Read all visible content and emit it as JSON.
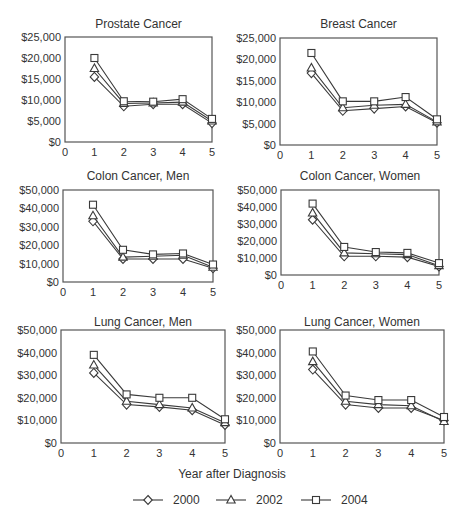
{
  "figure": {
    "xlabel": "Year after Diagnosis",
    "legend": [
      {
        "label": "2000",
        "marker": "diamond"
      },
      {
        "label": "2002",
        "marker": "triangle"
      },
      {
        "label": "2004",
        "marker": "square"
      }
    ]
  },
  "chart_data": [
    {
      "type": "line",
      "title": "Prostate Cancer",
      "xlabel": "Year after Diagnosis",
      "ylabel": "",
      "x": [
        1,
        2,
        3,
        4,
        5
      ],
      "xticks": [
        0,
        1,
        2,
        3,
        4,
        5
      ],
      "xlim": [
        0,
        5
      ],
      "yticks": [
        "$0",
        "$5,000",
        "$10,000",
        "$15,000",
        "$20,000",
        "$25,000"
      ],
      "ylim": [
        0,
        25000
      ],
      "grid": false,
      "series": [
        {
          "name": "2000",
          "marker": "diamond",
          "values": [
            15500,
            8500,
            9000,
            9000,
            4500
          ]
        },
        {
          "name": "2002",
          "marker": "triangle",
          "values": [
            17500,
            9200,
            9300,
            9500,
            5000
          ]
        },
        {
          "name": "2004",
          "marker": "square",
          "values": [
            20000,
            9700,
            9600,
            10200,
            5500
          ]
        }
      ]
    },
    {
      "type": "line",
      "title": "Breast Cancer",
      "xlabel": "Year after Diagnosis",
      "ylabel": "",
      "x": [
        1,
        2,
        3,
        4,
        5
      ],
      "xticks": [
        0,
        1,
        2,
        3,
        4,
        5
      ],
      "xlim": [
        0,
        5
      ],
      "yticks": [
        "$0",
        "$5,000",
        "$10,000",
        "$15,000",
        "$20,000",
        "$25,000"
      ],
      "ylim": [
        0,
        25000
      ],
      "grid": false,
      "series": [
        {
          "name": "2000",
          "marker": "diamond",
          "values": [
            16800,
            8000,
            8500,
            9000,
            5200
          ]
        },
        {
          "name": "2002",
          "marker": "triangle",
          "values": [
            18000,
            8700,
            9300,
            9500,
            5400
          ]
        },
        {
          "name": "2004",
          "marker": "square",
          "values": [
            21500,
            10200,
            10200,
            11200,
            6000
          ]
        }
      ]
    },
    {
      "type": "line",
      "title": "Colon Cancer, Men",
      "xlabel": "Year after Diagnosis",
      "ylabel": "",
      "x": [
        1,
        2,
        3,
        4,
        5
      ],
      "xticks": [
        0,
        1,
        2,
        3,
        4,
        5
      ],
      "xlim": [
        0,
        5
      ],
      "yticks": [
        "$0",
        "$10,000",
        "$20,000",
        "$30,000",
        "$40,000",
        "$50,000"
      ],
      "ylim": [
        0,
        50000
      ],
      "grid": false,
      "series": [
        {
          "name": "2000",
          "marker": "diamond",
          "values": [
            33000,
            12500,
            12500,
            12500,
            7500
          ]
        },
        {
          "name": "2002",
          "marker": "triangle",
          "values": [
            36000,
            13500,
            14000,
            14500,
            8000
          ]
        },
        {
          "name": "2004",
          "marker": "square",
          "values": [
            42000,
            17500,
            15000,
            15500,
            9500
          ]
        }
      ]
    },
    {
      "type": "line",
      "title": "Colon Cancer, Women",
      "xlabel": "Year after Diagnosis",
      "ylabel": "",
      "x": [
        1,
        2,
        3,
        4,
        5
      ],
      "xticks": [
        0,
        1,
        2,
        3,
        4,
        5
      ],
      "xlim": [
        0,
        5
      ],
      "yticks": [
        "$0",
        "$10,000",
        "$20,000",
        "$30,000",
        "$40,000",
        "$50,000"
      ],
      "ylim": [
        0,
        50000
      ],
      "grid": false,
      "series": [
        {
          "name": "2000",
          "marker": "diamond",
          "values": [
            32500,
            11000,
            11000,
            10500,
            5000
          ]
        },
        {
          "name": "2002",
          "marker": "triangle",
          "values": [
            36500,
            13000,
            12500,
            12000,
            5500
          ]
        },
        {
          "name": "2004",
          "marker": "square",
          "values": [
            42000,
            16500,
            13500,
            13000,
            7000
          ]
        }
      ]
    },
    {
      "type": "line",
      "title": "Lung Cancer, Men",
      "xlabel": "Year after Diagnosis",
      "ylabel": "",
      "x": [
        1,
        2,
        3,
        4,
        5
      ],
      "xticks": [
        0,
        1,
        2,
        3,
        4,
        5
      ],
      "xlim": [
        0,
        5
      ],
      "yticks": [
        "$0",
        "$10,000",
        "$20,000",
        "$30,000",
        "$40,000",
        "$50,000"
      ],
      "ylim": [
        0,
        50000
      ],
      "grid": false,
      "series": [
        {
          "name": "2000",
          "marker": "diamond",
          "values": [
            31000,
            17000,
            16000,
            14500,
            8000
          ]
        },
        {
          "name": "2002",
          "marker": "triangle",
          "values": [
            34500,
            18500,
            17000,
            15500,
            9000
          ]
        },
        {
          "name": "2004",
          "marker": "square",
          "values": [
            39000,
            21500,
            20000,
            20000,
            10500
          ]
        }
      ]
    },
    {
      "type": "line",
      "title": "Lung Cancer, Women",
      "xlabel": "Year after Diagnosis",
      "ylabel": "",
      "x": [
        1,
        2,
        3,
        4,
        5
      ],
      "xticks": [
        0,
        1,
        2,
        3,
        4,
        5
      ],
      "xlim": [
        0,
        5
      ],
      "yticks": [
        "$0",
        "$10,000",
        "$20,000",
        "$30,000",
        "$40,000",
        "$50,000"
      ],
      "ylim": [
        0,
        50000
      ],
      "grid": false,
      "series": [
        {
          "name": "2000",
          "marker": "diamond",
          "values": [
            32500,
            17000,
            15500,
            15500,
            10000
          ]
        },
        {
          "name": "2002",
          "marker": "triangle",
          "values": [
            36000,
            18500,
            17000,
            16500,
            9500
          ]
        },
        {
          "name": "2004",
          "marker": "square",
          "values": [
            40500,
            21000,
            19000,
            19000,
            11500
          ]
        }
      ]
    }
  ]
}
